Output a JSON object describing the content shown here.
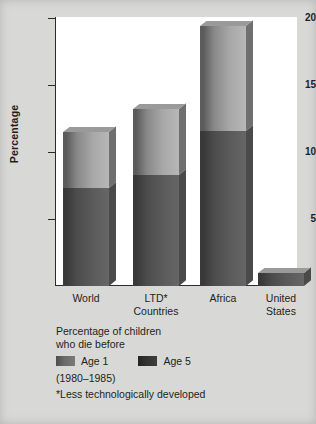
{
  "chart_data": {
    "type": "bar",
    "title": "",
    "subtitle": "",
    "xlabel": "",
    "ylabel": "Percentage",
    "ylim": [
      0,
      20
    ],
    "yticks": [
      5,
      10,
      15,
      20
    ],
    "grid": false,
    "legend_position": "below-plot",
    "stacked_overlay": true,
    "categories": [
      "World",
      "LTD*\nCountries",
      "Africa",
      "United\nStates"
    ],
    "category_lines": [
      [
        "World"
      ],
      [
        "LTD*",
        "Countries"
      ],
      [
        "Africa"
      ],
      [
        "United",
        "States"
      ]
    ],
    "series": [
      {
        "name": "Age 1",
        "values": [
          7.3,
          8.3,
          11.6,
          1.0
        ],
        "color": "#6b6b6b"
      },
      {
        "name": "Age 5",
        "values": [
          11.5,
          13.2,
          19.4,
          1.0
        ],
        "color": "#333333"
      }
    ],
    "annotations": [
      "Percentage of children",
      "who die before",
      "(1980–1985)",
      "*Less technologically developed"
    ]
  },
  "axis": {
    "y_title": "Percentage",
    "ticks": [
      {
        "value": 20,
        "label": "20"
      },
      {
        "value": 15,
        "label": "15"
      },
      {
        "value": 10,
        "label": "10"
      },
      {
        "value": 5,
        "label": "5"
      }
    ]
  },
  "legend": {
    "title_line1": "Percentage of children",
    "title_line2": "who die before",
    "items": [
      {
        "label": "Age 1",
        "swatch": "age1-swatch"
      },
      {
        "label": "Age 5",
        "swatch": "age5-swatch"
      }
    ],
    "years": "(1980–1985)"
  },
  "footnote": {
    "text": "*Less technologically developed"
  }
}
